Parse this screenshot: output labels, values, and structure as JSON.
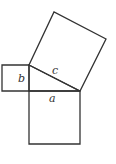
{
  "diagram": {
    "labels": {
      "a": "a",
      "b": "b",
      "c": "c"
    },
    "stroke_color": "#333333",
    "background": "#ffffff"
  }
}
